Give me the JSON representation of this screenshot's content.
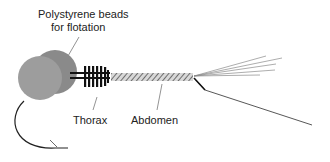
{
  "diagram": {
    "type": "labeled-illustration",
    "labels": {
      "beads_line1": "Polystyrene beads",
      "beads_line2": "for flotation",
      "thorax": "Thorax",
      "abdomen": "Abdomen"
    },
    "parts": [
      {
        "name": "polystyrene-beads",
        "shape": "two overlapping circles",
        "color": "#9a9a9a"
      },
      {
        "name": "thorax",
        "shape": "segmented bar with vertical ribs",
        "color": "#111111"
      },
      {
        "name": "abdomen",
        "shape": "diagonally hatched bar",
        "color": "#888888"
      },
      {
        "name": "cerci",
        "shape": "fan of thin lines",
        "color": "#8a8a8a"
      },
      {
        "name": "tail-filament",
        "shape": "long bent line",
        "color": "#444444"
      },
      {
        "name": "hook",
        "shape": "curved arrow",
        "color": "#222222"
      }
    ],
    "colors": {
      "bead_front": "#9b9b9b",
      "bead_back": "#8a8a8a",
      "ink": "#111111",
      "hatch": "#7a7a7a",
      "leader": "#777777"
    }
  }
}
